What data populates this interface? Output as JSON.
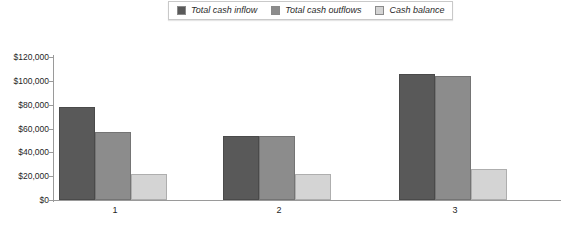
{
  "chart_data": {
    "type": "bar",
    "title": "",
    "xlabel": "",
    "ylabel": "",
    "categories": [
      "1",
      "2",
      "3"
    ],
    "series": [
      {
        "name": "Total cash inflow",
        "color": "#595959",
        "values": [
          78000,
          54000,
          106000
        ]
      },
      {
        "name": "Total cash outflows",
        "color": "#8c8c8c",
        "values": [
          57000,
          54000,
          104000
        ]
      },
      {
        "name": "Cash balance",
        "color": "#d4d4d4",
        "values": [
          22000,
          22000,
          26000
        ]
      }
    ],
    "ylim": [
      0,
      120000
    ],
    "ytick_values": [
      120000,
      100000,
      80000,
      60000,
      40000,
      20000,
      0
    ],
    "ytick_labels": [
      "$120,000",
      "$100,000",
      "$80,000",
      "$60,000",
      "$40,000",
      "$20,000",
      "$0"
    ],
    "grid": false,
    "legend_position": "top-center"
  },
  "legend": {
    "items": [
      {
        "label": "Total cash inflow",
        "swatch": "#595959"
      },
      {
        "label": "Total cash outflows",
        "swatch": "#8c8c8c"
      },
      {
        "label": "Cash balance",
        "swatch": "#d4d4d4"
      }
    ]
  }
}
